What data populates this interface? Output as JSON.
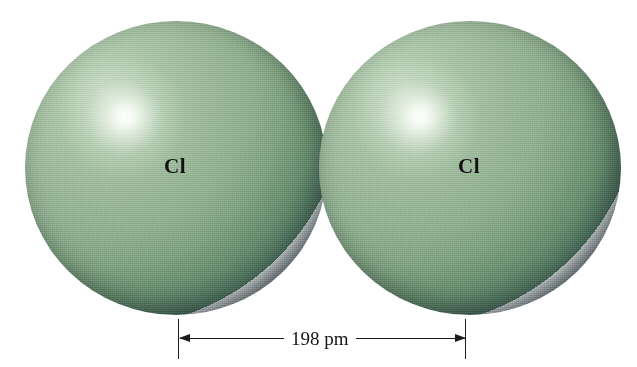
{
  "figure": {
    "type": "molecular-space-filling-model",
    "background_color": "#ffffff",
    "width": 637,
    "height": 367
  },
  "atoms": [
    {
      "label": "Cl",
      "name": "chlorine-atom-left",
      "color_body": "#93b295",
      "color_highlight": "#f2faf0",
      "color_shadow": "#242a32",
      "cx": 176,
      "cy": 168,
      "rx": 151,
      "ry": 147,
      "highlight_x": "32.5%",
      "highlight_y": "33%",
      "label_x": 176,
      "label_y": 166
    },
    {
      "label": "Cl",
      "name": "chlorine-atom-right",
      "color_body": "#93b295",
      "color_highlight": "#f2faf0",
      "color_shadow": "#242a32",
      "cx": 470,
      "cy": 168,
      "rx": 151,
      "ry": 147,
      "highlight_x": "32.5%",
      "highlight_y": "33%",
      "label_x": 470,
      "label_y": 166
    }
  ],
  "dimension": {
    "label": "198 pm",
    "value": 198,
    "unit": "pm",
    "quantity": "bond length",
    "line_color": "#1c1c1c",
    "left_tick_x": 178,
    "right_tick_x": 465,
    "tick_top_y": 319,
    "tick_bottom_y": 359,
    "line_y": 338,
    "label_center_x": 320,
    "label_y": 329
  }
}
